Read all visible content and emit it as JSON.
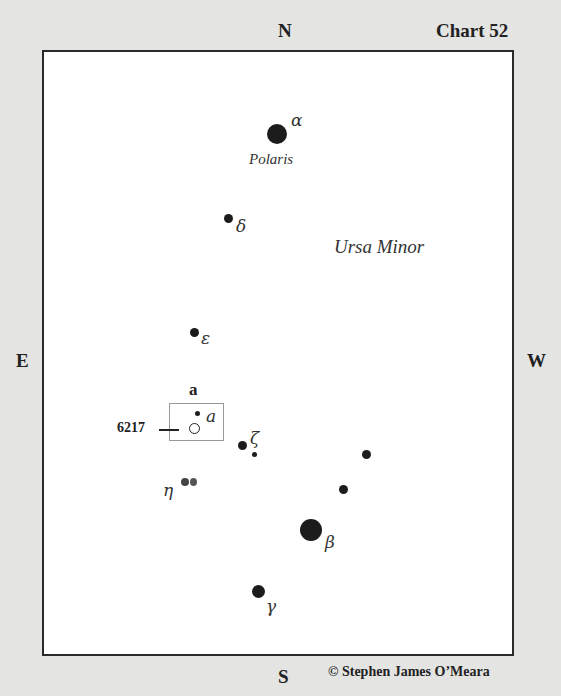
{
  "header": {
    "chart_label": "Chart 52"
  },
  "compass": {
    "north": "N",
    "south": "S",
    "east": "E",
    "west": "W"
  },
  "constellation": {
    "name": "Ursa Minor"
  },
  "stars": {
    "alpha": {
      "greek": "α",
      "name": "Polaris"
    },
    "beta": {
      "greek": "β"
    },
    "gamma": {
      "greek": "γ"
    },
    "delta": {
      "greek": "δ"
    },
    "epsilon": {
      "greek": "ε"
    },
    "zeta": {
      "greek": "ζ"
    },
    "eta": {
      "greek": "η"
    }
  },
  "object": {
    "ngc": "6217",
    "box_label": "a",
    "star_label": "a"
  },
  "footer": {
    "copyright": "© Stephen James O’Meara"
  },
  "colors": {
    "background": "#e4e4e2",
    "frame": "#2a2a2a",
    "star": "#1c1c1c"
  }
}
